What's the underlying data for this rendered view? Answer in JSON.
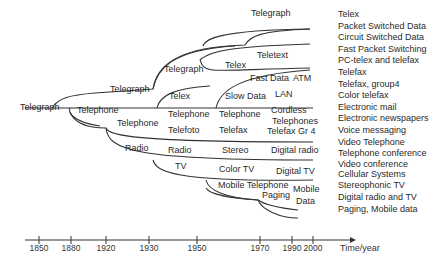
{
  "diagram": {
    "root": "Telegraph",
    "branch_labels": [
      {
        "id": "telegraph-1920",
        "text": "Telegraph",
        "x": 110,
        "y": 92
      },
      {
        "id": "telegraph-1930",
        "text": "Telegraph",
        "x": 164,
        "y": 72
      },
      {
        "id": "telegraph-1970",
        "text": "Telegraph",
        "x": 251,
        "y": 16
      },
      {
        "id": "telex-1950",
        "text": "Telex",
        "x": 169,
        "y": 99
      },
      {
        "id": "telex-1970",
        "text": "Telex",
        "x": 225,
        "y": 68
      },
      {
        "id": "teletext",
        "text": "Teletext",
        "x": 257,
        "y": 58
      },
      {
        "id": "fast-data",
        "text": "Fast Data",
        "x": 250,
        "y": 81
      },
      {
        "id": "atm",
        "text": "ATM",
        "x": 293,
        "y": 81
      },
      {
        "id": "slow-data",
        "text": "Slow Data",
        "x": 225,
        "y": 99
      },
      {
        "id": "lan",
        "text": "LAN",
        "x": 275,
        "y": 97
      },
      {
        "id": "telephone-1880",
        "text": "Telephone",
        "x": 77,
        "y": 113
      },
      {
        "id": "telephone-1920",
        "text": "Telephone",
        "x": 117,
        "y": 126
      },
      {
        "id": "telephone-1950",
        "text": "Telephone",
        "x": 168,
        "y": 117
      },
      {
        "id": "telephone-1970",
        "text": "Telephone",
        "x": 219,
        "y": 117
      },
      {
        "id": "cordless",
        "text": "Cordless",
        "x": 271,
        "y": 113
      },
      {
        "id": "telephones",
        "text": "Telephones",
        "x": 272,
        "y": 124
      },
      {
        "id": "telefoto",
        "text": "Telefoto",
        "x": 168,
        "y": 133
      },
      {
        "id": "telefax",
        "text": "Telefax",
        "x": 219,
        "y": 133
      },
      {
        "id": "telefax-gr4",
        "text": "Telefax Gr 4",
        "x": 267,
        "y": 134
      },
      {
        "id": "radio-1920",
        "text": "Radio",
        "x": 125,
        "y": 151
      },
      {
        "id": "radio-1950",
        "text": "Radio",
        "x": 168,
        "y": 153
      },
      {
        "id": "stereo",
        "text": "Stereo",
        "x": 222,
        "y": 153
      },
      {
        "id": "digital-radio",
        "text": "Digital radio",
        "x": 271,
        "y": 153
      },
      {
        "id": "tv",
        "text": "TV",
        "x": 175,
        "y": 169
      },
      {
        "id": "color-tv",
        "text": "Color TV",
        "x": 219,
        "y": 172
      },
      {
        "id": "digital-tv",
        "text": "Digital TV",
        "x": 276,
        "y": 174
      },
      {
        "id": "mobile-telephone",
        "text": "Mobile Telephone",
        "x": 218,
        "y": 188
      },
      {
        "id": "paging",
        "text": "Paging",
        "x": 262,
        "y": 198
      },
      {
        "id": "mobile",
        "text": "Mobile",
        "x": 293,
        "y": 192
      },
      {
        "id": "data",
        "text": "Data",
        "x": 296,
        "y": 204
      }
    ],
    "service_list": [
      "Telex",
      "Packet Switched Data",
      "Circuit Switched Data",
      "Fast Packet Switching",
      "PC-telex and telefax",
      "Telefax",
      "Telefax, group4",
      "Color telefax",
      "Electronic mail",
      "Electronic newspapers",
      "Voice messaging",
      "Video Telephone",
      "Telephone conference",
      "Video conference",
      "Cellular Systems",
      "Stereophonic TV",
      "Digital radio and TV",
      "Paging, Mobile data"
    ],
    "timeline": {
      "ticks": [
        {
          "label": "1850",
          "x": 39
        },
        {
          "label": "1880",
          "x": 71
        },
        {
          "label": "1920",
          "x": 106
        },
        {
          "label": "1930",
          "x": 149
        },
        {
          "label": "1950",
          "x": 197
        },
        {
          "label": "1970",
          "x": 260
        },
        {
          "label": "1990",
          "x": 292
        },
        {
          "label": "2000",
          "x": 313
        }
      ],
      "axis_title": "Time/year"
    },
    "colors": {
      "line": "#333333",
      "text": "#2a2a2a",
      "background": "#ffffff"
    }
  }
}
